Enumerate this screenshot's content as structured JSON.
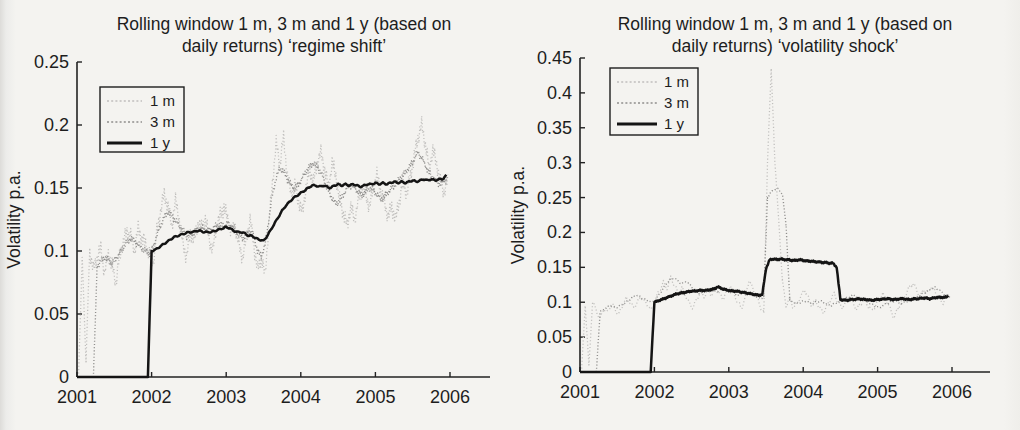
{
  "page": {
    "background": "#f4f3f0",
    "text_color": "#1d1d1d",
    "axis_color": "#222222"
  },
  "chart_data": [
    {
      "type": "line",
      "title_lines": [
        "Rolling window 1 m, 3 m and 1 y (based on",
        "daily returns) ‘regime shift’"
      ],
      "xlabel": "",
      "ylabel": "Volatility p.a.",
      "xlim": [
        2001,
        2006.55
      ],
      "ylim": [
        0,
        0.25
      ],
      "grid": false,
      "legend_position": "upper-left",
      "x_tick_labels": [
        "2001",
        "2002",
        "2003",
        "2004",
        "2005",
        "2006"
      ],
      "x_tick_values": [
        2001,
        2002,
        2003,
        2004,
        2005,
        2006
      ],
      "y_tick_labels": [
        "0",
        "0.05",
        "0.1",
        "0.15",
        "0.2",
        "0.25"
      ],
      "y_tick_values": [
        0,
        0.05,
        0.1,
        0.15,
        0.2,
        0.25
      ],
      "series": [
        {
          "name": "1 m",
          "color": "#c0bfbd",
          "dash": "1.1,2.3",
          "width": 1.3,
          "jitter": 0.007,
          "seed": 1.3,
          "x0": 2001.02,
          "dx": 0.05,
          "values": [
            0.0,
            0.095,
            0.012,
            0.1,
            0.085,
            0.095,
            0.102,
            0.082,
            0.098,
            0.088,
            0.075,
            0.095,
            0.108,
            0.115,
            0.112,
            0.1,
            0.118,
            0.11,
            0.105,
            0.098,
            0.09,
            0.115,
            0.132,
            0.145,
            0.135,
            0.12,
            0.14,
            0.125,
            0.105,
            0.095,
            0.115,
            0.108,
            0.122,
            0.118,
            0.125,
            0.11,
            0.1,
            0.12,
            0.128,
            0.135,
            0.125,
            0.115,
            0.12,
            0.105,
            0.095,
            0.11,
            0.125,
            0.105,
            0.085,
            0.095,
            0.08,
            0.12,
            0.155,
            0.185,
            0.17,
            0.19,
            0.16,
            0.145,
            0.152,
            0.14,
            0.13,
            0.15,
            0.165,
            0.155,
            0.17,
            0.178,
            0.165,
            0.15,
            0.17,
            0.16,
            0.14,
            0.13,
            0.12,
            0.135,
            0.125,
            0.14,
            0.15,
            0.145,
            0.135,
            0.15,
            0.16,
            0.148,
            0.138,
            0.128,
            0.135,
            0.125,
            0.14,
            0.155,
            0.145,
            0.16,
            0.175,
            0.19,
            0.2,
            0.185,
            0.165,
            0.18,
            0.17,
            0.155,
            0.147,
            0.155
          ]
        },
        {
          "name": "3 m",
          "color": "#8f8e8c",
          "dash": "1.1,2.1",
          "width": 1.35,
          "jitter": 0.003,
          "seed": 4.1,
          "x0": 2001.22,
          "dx": 0.05,
          "values": [
            0.0,
            0.088,
            0.092,
            0.095,
            0.093,
            0.09,
            0.094,
            0.098,
            0.103,
            0.107,
            0.11,
            0.108,
            0.105,
            0.102,
            0.1,
            0.098,
            0.103,
            0.112,
            0.12,
            0.127,
            0.131,
            0.128,
            0.124,
            0.12,
            0.116,
            0.112,
            0.113,
            0.115,
            0.117,
            0.118,
            0.117,
            0.116,
            0.118,
            0.12,
            0.121,
            0.12,
            0.122,
            0.12,
            0.117,
            0.113,
            0.11,
            0.113,
            0.116,
            0.112,
            0.1,
            0.096,
            0.104,
            0.125,
            0.145,
            0.158,
            0.166,
            0.163,
            0.157,
            0.152,
            0.15,
            0.153,
            0.158,
            0.163,
            0.167,
            0.17,
            0.167,
            0.162,
            0.155,
            0.148,
            0.142,
            0.137,
            0.14,
            0.145,
            0.15,
            0.152,
            0.15,
            0.147,
            0.144,
            0.147,
            0.15,
            0.148,
            0.145,
            0.141,
            0.143,
            0.147,
            0.15,
            0.153,
            0.157,
            0.16,
            0.164,
            0.168,
            0.173,
            0.178,
            0.174,
            0.168,
            0.162,
            0.158,
            0.155,
            0.153,
            0.156,
            0.157
          ]
        },
        {
          "name": "1 y",
          "color": "#141414",
          "dash": "",
          "width": 2.5,
          "jitter": 0.0012,
          "seed": 7.7,
          "x0": 2001.0,
          "dx": 0.05,
          "values": [
            0,
            0,
            0,
            0,
            0,
            0,
            0,
            0,
            0,
            0,
            0,
            0,
            0,
            0,
            0,
            0,
            0,
            0,
            0,
            0,
            0.1,
            0.101,
            0.103,
            0.105,
            0.107,
            0.109,
            0.111,
            0.112,
            0.113,
            0.114,
            0.115,
            0.115,
            0.116,
            0.116,
            0.115,
            0.115,
            0.115,
            0.116,
            0.117,
            0.118,
            0.119,
            0.118,
            0.116,
            0.115,
            0.115,
            0.114,
            0.112,
            0.112,
            0.11,
            0.109,
            0.108,
            0.112,
            0.117,
            0.122,
            0.127,
            0.132,
            0.136,
            0.139,
            0.142,
            0.144,
            0.146,
            0.148,
            0.15,
            0.152,
            0.152,
            0.151,
            0.152,
            0.151,
            0.15,
            0.152,
            0.153,
            0.152,
            0.153,
            0.152,
            0.153,
            0.152,
            0.151,
            0.152,
            0.153,
            0.153,
            0.154,
            0.153,
            0.154,
            0.153,
            0.154,
            0.155,
            0.154,
            0.155,
            0.154,
            0.155,
            0.156,
            0.155,
            0.156,
            0.157,
            0.156,
            0.157,
            0.156,
            0.157,
            0.157,
            0.16
          ]
        }
      ]
    },
    {
      "type": "line",
      "title_lines": [
        "Rolling window 1 m, 3 m and 1 y (based on",
        "daily returns) ‘volatility shock’"
      ],
      "xlabel": "",
      "ylabel": "Volatility p.a.",
      "xlim": [
        2001,
        2006.5
      ],
      "ylim": [
        0,
        0.45
      ],
      "grid": false,
      "legend_position": "upper-left",
      "x_tick_labels": [
        "2001",
        "2002",
        "2003",
        "2004",
        "2005",
        "2006"
      ],
      "x_tick_values": [
        2001,
        2002,
        2003,
        2004,
        2005,
        2006
      ],
      "y_tick_labels": [
        "0",
        "0.05",
        "0.1",
        "0.15",
        "0.2",
        "0.25",
        "0.3",
        "0.35",
        "0.4",
        "0.45"
      ],
      "y_tick_values": [
        0,
        0.05,
        0.1,
        0.15,
        0.2,
        0.25,
        0.3,
        0.35,
        0.4,
        0.45
      ],
      "series": [
        {
          "name": "1 m",
          "color": "#c0bfbd",
          "dash": "1.1,2.3",
          "width": 1.3,
          "jitter": 0.007,
          "seed": 2.6,
          "x0": 2001.02,
          "dx": 0.05,
          "values": [
            0.0,
            0.095,
            0.01,
            0.1,
            0.088,
            0.075,
            0.092,
            0.085,
            0.098,
            0.09,
            0.082,
            0.095,
            0.105,
            0.1,
            0.092,
            0.1,
            0.108,
            0.1,
            0.095,
            0.088,
            0.105,
            0.118,
            0.128,
            0.12,
            0.135,
            0.125,
            0.112,
            0.12,
            0.11,
            0.098,
            0.092,
            0.105,
            0.115,
            0.108,
            0.118,
            0.11,
            0.12,
            0.112,
            0.105,
            0.115,
            0.125,
            0.112,
            0.1,
            0.092,
            0.105,
            0.132,
            0.12,
            0.108,
            0.095,
            0.085,
            0.3,
            0.435,
            0.3,
            0.22,
            0.13,
            0.095,
            0.105,
            0.092,
            0.1,
            0.108,
            0.118,
            0.105,
            0.095,
            0.102,
            0.092,
            0.085,
            0.095,
            0.105,
            0.112,
            0.1,
            0.092,
            0.1,
            0.108,
            0.098,
            0.09,
            0.098,
            0.105,
            0.095,
            0.088,
            0.095,
            0.105,
            0.112,
            0.102,
            0.09,
            0.078,
            0.09,
            0.1,
            0.11,
            0.12,
            0.128,
            0.118,
            0.108,
            0.118,
            0.112,
            0.122,
            0.115,
            0.105,
            0.098,
            0.108,
            0.11
          ]
        },
        {
          "name": "3 m",
          "color": "#8f8e8c",
          "dash": "1.1,2.1",
          "width": 1.35,
          "jitter": 0.003,
          "seed": 5.9,
          "x0": 2001.22,
          "dx": 0.05,
          "values": [
            0.0,
            0.086,
            0.09,
            0.093,
            0.095,
            0.092,
            0.094,
            0.097,
            0.1,
            0.104,
            0.108,
            0.11,
            0.107,
            0.104,
            0.102,
            0.1,
            0.104,
            0.112,
            0.12,
            0.128,
            0.133,
            0.135,
            0.13,
            0.126,
            0.13,
            0.126,
            0.12,
            0.115,
            0.112,
            0.115,
            0.118,
            0.117,
            0.115,
            0.117,
            0.12,
            0.118,
            0.115,
            0.113,
            0.11,
            0.112,
            0.115,
            0.113,
            0.11,
            0.108,
            0.105,
            0.108,
            0.25,
            0.258,
            0.262,
            0.262,
            0.255,
            0.21,
            0.103,
            0.1,
            0.098,
            0.1,
            0.102,
            0.1,
            0.098,
            0.1,
            0.102,
            0.1,
            0.097,
            0.095,
            0.098,
            0.1,
            0.102,
            0.105,
            0.108,
            0.11,
            0.108,
            0.105,
            0.102,
            0.1,
            0.097,
            0.094,
            0.092,
            0.095,
            0.098,
            0.1,
            0.102,
            0.1,
            0.098,
            0.1,
            0.103,
            0.105,
            0.107,
            0.11,
            0.113,
            0.116,
            0.119,
            0.121,
            0.118,
            0.114,
            0.11,
            0.108
          ]
        },
        {
          "name": "1 y",
          "color": "#141414",
          "dash": "",
          "width": 2.5,
          "jitter": 0.0012,
          "seed": 9.2,
          "x0": 2001.0,
          "dx": 0.05,
          "values": [
            0,
            0,
            0,
            0,
            0,
            0,
            0,
            0,
            0,
            0,
            0,
            0,
            0,
            0,
            0,
            0,
            0,
            0,
            0,
            0,
            0.1,
            0.102,
            0.104,
            0.106,
            0.108,
            0.11,
            0.112,
            0.113,
            0.114,
            0.115,
            0.116,
            0.116,
            0.117,
            0.117,
            0.117,
            0.118,
            0.119,
            0.122,
            0.12,
            0.118,
            0.117,
            0.116,
            0.116,
            0.115,
            0.114,
            0.113,
            0.112,
            0.111,
            0.11,
            0.111,
            0.148,
            0.161,
            0.162,
            0.161,
            0.162,
            0.161,
            0.161,
            0.16,
            0.16,
            0.161,
            0.16,
            0.159,
            0.159,
            0.158,
            0.158,
            0.157,
            0.157,
            0.156,
            0.156,
            0.15,
            0.104,
            0.103,
            0.103,
            0.104,
            0.104,
            0.105,
            0.104,
            0.104,
            0.103,
            0.103,
            0.104,
            0.104,
            0.105,
            0.105,
            0.104,
            0.104,
            0.105,
            0.105,
            0.104,
            0.104,
            0.105,
            0.105,
            0.106,
            0.106,
            0.105,
            0.106,
            0.107,
            0.107,
            0.107,
            0.108
          ]
        }
      ]
    }
  ]
}
